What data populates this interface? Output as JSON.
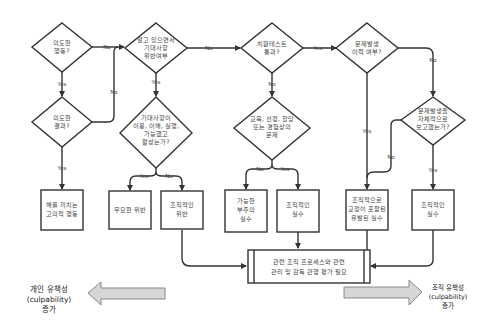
{
  "diagram": {
    "decisions": [
      {
        "id": "d1",
        "lines": [
          "의도한",
          "행동?"
        ]
      },
      {
        "id": "d2",
        "lines": [
          "의도한",
          "결과?"
        ]
      },
      {
        "id": "d3",
        "lines": [
          "알고 있으면서",
          "기대사항",
          "위반여부"
        ]
      },
      {
        "id": "d4",
        "lines": [
          "기대사항이",
          "이용, 이해, 실행,",
          "가능했고",
          "활성는가?"
        ]
      },
      {
        "id": "d5",
        "lines": [
          "치환테스트",
          "통과?"
        ]
      },
      {
        "id": "d6",
        "lines": [
          "교육, 선정, 할당",
          "또는 경험상의",
          "문제"
        ]
      },
      {
        "id": "d7",
        "lines": [
          "문제발생",
          "이력 여부?"
        ]
      },
      {
        "id": "d8",
        "lines": [
          "문제발생을",
          "자체적으로",
          "보고했는가?"
        ]
      }
    ],
    "outcomes": [
      {
        "id": "o1",
        "lines": [
          "해를 끼치는",
          "고의적 행동"
        ]
      },
      {
        "id": "o2",
        "lines": [
          "무모한 위반"
        ]
      },
      {
        "id": "o3",
        "lines": [
          "조직적인",
          "위반"
        ]
      },
      {
        "id": "o4",
        "lines": [
          "가능한",
          "부주의",
          "실수"
        ]
      },
      {
        "id": "o5",
        "lines": [
          "조직적인",
          "실수"
        ]
      },
      {
        "id": "o6",
        "lines": [
          "조직적으로",
          "교정이 포함된",
          "유발된 실수"
        ]
      },
      {
        "id": "o7",
        "lines": [
          "조직적인",
          "실수"
        ]
      }
    ],
    "process": {
      "lines": [
        "관련 조직 프로세스와 관련",
        "관리 및 감독 관행 평가 필요"
      ]
    },
    "edge_labels": {
      "d1_no": "No",
      "d1_yes": "Yes",
      "d2_no": "No",
      "d2_yes": "Yes",
      "d3_no": "No",
      "d3_yes": "Yes",
      "d4_yes": "Yes",
      "d4_no": "No",
      "d5_yes": "Yes",
      "d5_no": "No",
      "d6_no": "No",
      "d6_yes": "Yes",
      "d7_no": "No",
      "d7_yes": "Yes",
      "d8_no": "No",
      "d8_yes": "Yes"
    },
    "left_arrow": {
      "lines": [
        "개인 유책성",
        "(culpability)",
        "증가"
      ]
    },
    "right_arrow": {
      "lines": [
        "조직 유책성",
        "(culpability)",
        "증가"
      ]
    }
  }
}
